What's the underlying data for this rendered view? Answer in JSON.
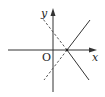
{
  "diagram": {
    "type": "coordinate-plane-lines",
    "axes": {
      "x_label": "x",
      "y_label": "y",
      "origin_label": "O"
    },
    "colors": {
      "axis": "#333333",
      "solid_line": "#333333",
      "dashed_line": "#555555",
      "label": "#222222"
    },
    "lines": [
      {
        "name": "solid-line",
        "style": "solid",
        "description": "V-shaped solid lines opening right, vertex on positive x-axis"
      },
      {
        "name": "dashed-line",
        "style": "dashed",
        "description": "V-shaped dashed lines opening left, vertex on positive x-axis"
      }
    ]
  }
}
